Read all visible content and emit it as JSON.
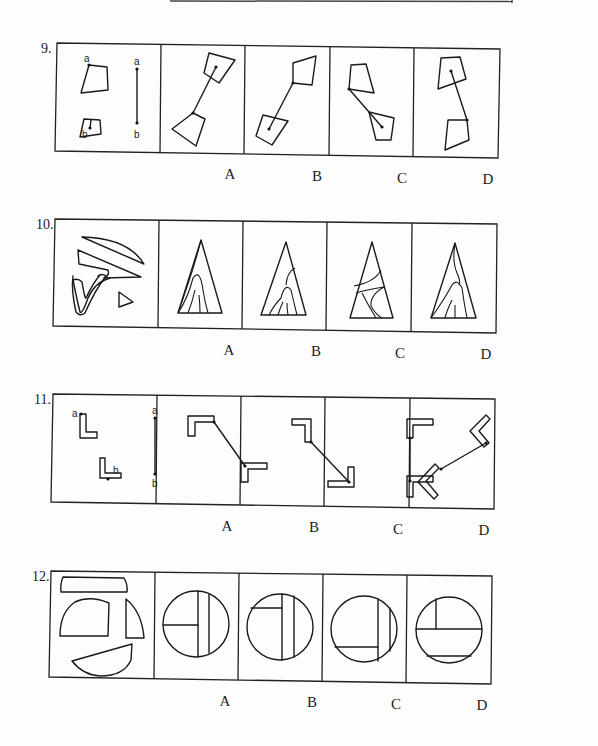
{
  "page": {
    "questions": [
      {
        "number": "9.",
        "type": "figure-assembly",
        "prompt_figure": {
          "description": "Two quadrilaterals with point a on one and point b on the other, joined by segment a-b",
          "point_labels": [
            "a",
            "b",
            "a",
            "b"
          ]
        },
        "options": [
          {
            "label": "A"
          },
          {
            "label": "B"
          },
          {
            "label": "C"
          },
          {
            "label": "D"
          }
        ]
      },
      {
        "number": "10.",
        "type": "shape-composition",
        "prompt_figure": {
          "description": "Several curved fragments and a small triangle to be assembled into a triangle"
        },
        "options": [
          {
            "label": "A"
          },
          {
            "label": "B"
          },
          {
            "label": "C"
          },
          {
            "label": "D"
          }
        ]
      },
      {
        "number": "11.",
        "type": "figure-assembly",
        "prompt_figure": {
          "description": "Two L-shapes with point a and point b, joined by segment a-b",
          "point_labels": [
            "a",
            "b",
            "a",
            "b"
          ]
        },
        "options": [
          {
            "label": "A"
          },
          {
            "label": "B"
          },
          {
            "label": "C"
          },
          {
            "label": "D"
          }
        ]
      },
      {
        "number": "12.",
        "type": "shape-composition",
        "prompt_figure": {
          "description": "Four circle fragments to be assembled into a full circle"
        },
        "options": [
          {
            "label": "A"
          },
          {
            "label": "B"
          },
          {
            "label": "C"
          },
          {
            "label": "D"
          }
        ]
      }
    ]
  },
  "colors": {
    "ink": "#1a1a1a",
    "background": "#fdfdfd"
  }
}
